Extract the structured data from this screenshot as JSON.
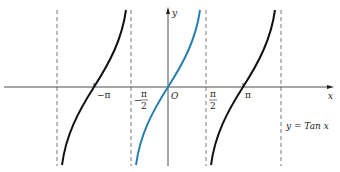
{
  "diagram": {
    "type": "function-graph",
    "function_label": "y = Tan x",
    "axis_labels": {
      "x": "x",
      "y": "y",
      "origin": "O"
    },
    "tick_labels": [
      {
        "id": "neg_pi",
        "text": "−π"
      },
      {
        "id": "neg_pi_over_2",
        "num": "π",
        "den": "2",
        "sign": "−"
      },
      {
        "id": "pi_over_2",
        "num": "π",
        "den": "2"
      },
      {
        "id": "pi",
        "text": "π"
      }
    ],
    "asymptotes": [
      "-3π/2",
      "-π/2",
      "π/2",
      "3π/2"
    ],
    "branches": [
      {
        "interval": "(-3π/2, -π/2)",
        "color": "#111111"
      },
      {
        "interval": "(-π/2, π/2)",
        "color": "#2a7fb0",
        "highlighted": true
      },
      {
        "interval": "(π/2, 3π/2)",
        "color": "#111111"
      }
    ]
  }
}
